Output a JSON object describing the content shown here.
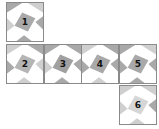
{
  "diagram": {
    "type": "cube-net",
    "faces": [
      {
        "label": "1",
        "x": 6,
        "y": 2
      },
      {
        "label": "2",
        "x": 6,
        "y": 44
      },
      {
        "label": "3",
        "x": 44,
        "y": 44
      },
      {
        "label": "4",
        "x": 81,
        "y": 44
      },
      {
        "label": "5",
        "x": 119,
        "y": 44
      },
      {
        "label": "6",
        "x": 119,
        "y": 85
      }
    ],
    "colors": {
      "dark": "#a9a9a9",
      "light": "#cfcfcf",
      "border": "#8a8a8a"
    }
  }
}
